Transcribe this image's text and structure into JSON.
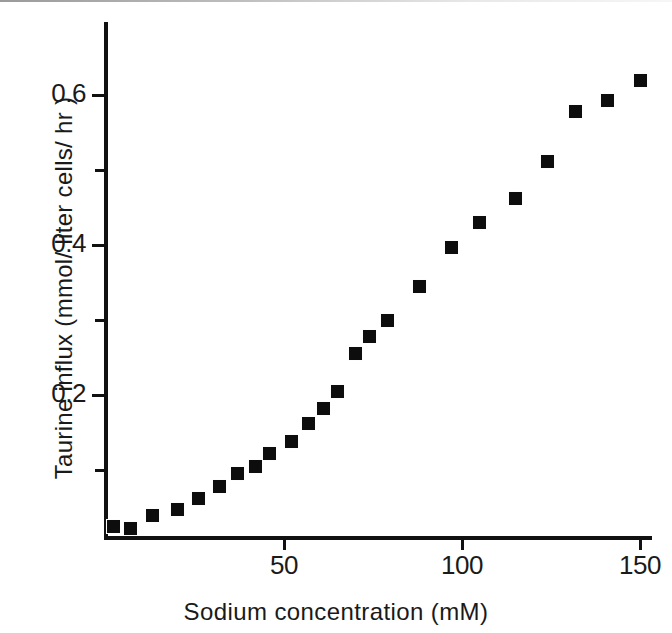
{
  "figure": {
    "background_color": "#ffffff",
    "ink_color": "#111111",
    "marker_color": "#0d0d0d"
  },
  "chart_data": {
    "type": "scatter",
    "title": "",
    "xlabel": "Sodium concentration  (mM)",
    "ylabel": "Taurine influx (mmol/ liter cells/ hr )",
    "xlim": [
      0,
      155
    ],
    "ylim": [
      0,
      0.66
    ],
    "grid": false,
    "legend": null,
    "x_ticks": [
      50,
      100,
      150
    ],
    "x_tick_labels": [
      "50",
      "100",
      "150"
    ],
    "y_ticks": [
      0.1,
      0.2,
      0.3,
      0.4,
      0.5,
      0.6
    ],
    "y_tick_labels": [
      "",
      "0.2",
      "",
      "0.4",
      "",
      "0.6"
    ],
    "y_major_ticks": [
      0.2,
      0.4,
      0.6
    ],
    "y_minor_ticks": [
      0.1,
      0.3,
      0.5
    ],
    "marker_shape": "square",
    "series": [
      {
        "name": "Taurine influx",
        "x": [
          2,
          7,
          13,
          20,
          26,
          32,
          37,
          42,
          46,
          52,
          57,
          61,
          65,
          70,
          74,
          79,
          88,
          97,
          105,
          115,
          124,
          132,
          141,
          150
        ],
        "y": [
          0.025,
          0.022,
          0.04,
          0.048,
          0.062,
          0.078,
          0.095,
          0.105,
          0.122,
          0.138,
          0.162,
          0.182,
          0.205,
          0.255,
          0.278,
          0.3,
          0.345,
          0.397,
          0.43,
          0.462,
          0.512,
          0.578,
          0.593,
          0.62
        ]
      }
    ]
  }
}
